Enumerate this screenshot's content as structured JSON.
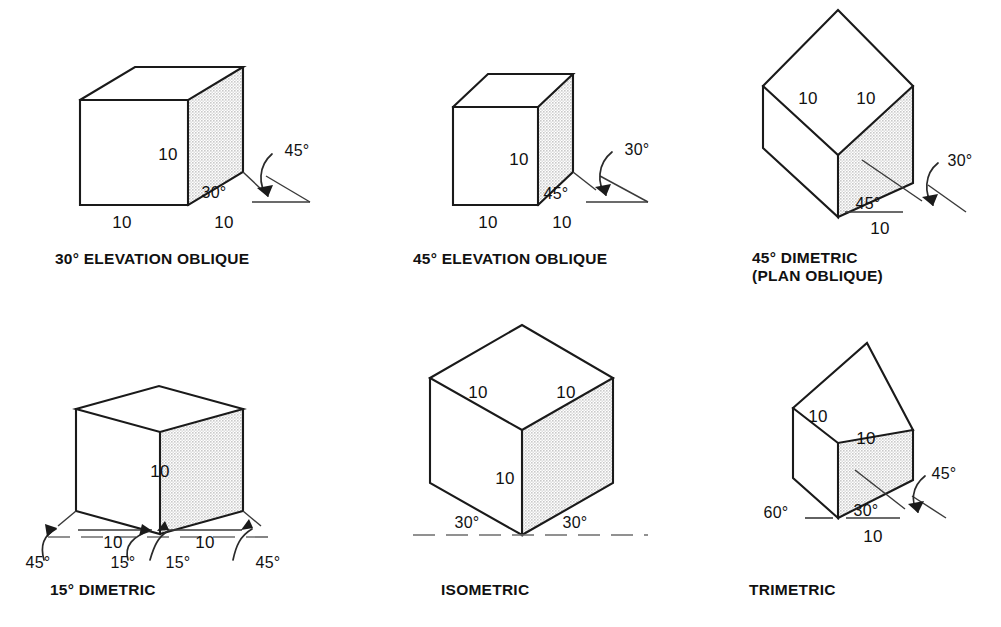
{
  "page": {
    "background_color": "#ffffff",
    "line_color": "#1a1a1a",
    "shade_color": "#d8d8d8",
    "width": 1001,
    "height": 627
  },
  "figures": [
    {
      "id": "elevation-oblique-30",
      "caption_line1": "30° ELEVATION OBLIQUE",
      "caption_line2": "",
      "dimensions": {
        "height": "10",
        "front_width": "10",
        "depth": "10"
      },
      "angles": {
        "receding": "30°",
        "arrow": "45°"
      }
    },
    {
      "id": "elevation-oblique-45",
      "caption_line1": "45° ELEVATION OBLIQUE",
      "caption_line2": "",
      "dimensions": {
        "height": "10",
        "front_width": "10",
        "depth": "10"
      },
      "angles": {
        "receding": "45°",
        "arrow": "30°"
      }
    },
    {
      "id": "dimetric-45-plan-oblique",
      "caption_line1": "45° DIMETRIC",
      "caption_line2": "(PLAN OBLIQUE)",
      "dimensions": {
        "left": "10",
        "right": "10",
        "base": "10"
      },
      "angles": {
        "receding": "45°",
        "arrow": "30°"
      }
    },
    {
      "id": "dimetric-15",
      "caption_line1": "15° DIMETRIC",
      "caption_line2": "",
      "dimensions": {
        "height": "10",
        "left": "10",
        "right": "10"
      },
      "angles": {
        "outer_left": "45°",
        "inner_left": "15°",
        "inner_right": "15°",
        "outer_right": "45°"
      }
    },
    {
      "id": "isometric",
      "caption_line1": "ISOMETRIC",
      "caption_line2": "",
      "dimensions": {
        "top_left": "10",
        "top_right": "10",
        "height": "10"
      },
      "angles": {
        "left": "30°",
        "right": "30°"
      }
    },
    {
      "id": "trimetric",
      "caption_line1": "TRIMETRIC",
      "caption_line2": "",
      "dimensions": {
        "top_left": "10",
        "top_right": "10",
        "base": "10"
      },
      "angles": {
        "left": "60°",
        "right": "30°",
        "arrow": "45°"
      }
    }
  ]
}
